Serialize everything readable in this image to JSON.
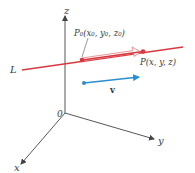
{
  "diagram": {
    "axes": {
      "z_label": "z",
      "y_label": "y",
      "x_label": "x",
      "origin_label": "0"
    },
    "line": {
      "label": "L",
      "color": "#d9383f"
    },
    "points": {
      "p0_label": "P₀(x₀, y₀, z₀)",
      "p_label": "P(x, y, z)",
      "color": "#d9383f"
    },
    "vector": {
      "label": "v",
      "color": "#2a8fd0"
    },
    "axis_color": "#444444"
  }
}
